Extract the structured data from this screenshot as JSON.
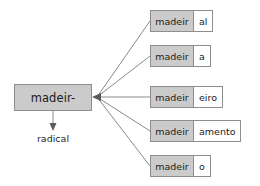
{
  "diagram": {
    "type": "morphology-derivation-tree",
    "radical": {
      "label": "madeir-",
      "caption": "radical"
    },
    "derived_words": [
      {
        "stem": "madeir",
        "suffix": "al"
      },
      {
        "stem": "madeir",
        "suffix": "a"
      },
      {
        "stem": "madeir",
        "suffix": "eiro"
      },
      {
        "stem": "madeir",
        "suffix": "amento"
      },
      {
        "stem": "madeir",
        "suffix": "o"
      }
    ],
    "colors": {
      "stem_fill": "#cbcbcb",
      "suffix_fill": "#ffffff",
      "border": "#8e8e8e",
      "connector": "#8a8a8a",
      "text": "#1c1c1c",
      "background": "#ffffff"
    }
  }
}
